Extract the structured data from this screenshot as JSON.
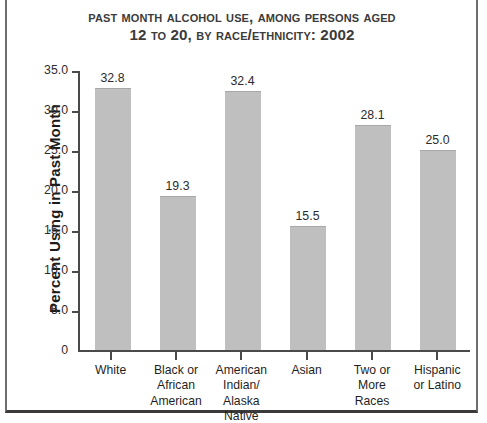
{
  "chart_data": {
    "type": "bar",
    "title": "Past Month Alcohol Use, Among Persons Aged 12 to 20, by Race/Ethnicity: 2002",
    "title_lines": [
      "Past Month Alcohol Use, Among Persons Aged",
      "12 to 20, by Race/Ethnicity: 2002"
    ],
    "xlabel": "",
    "ylabel": "Percent Using in Past Month",
    "categories": [
      "White",
      "Black or\nAfrican\nAmerican",
      "American\nIndian/\nAlaska\nNative",
      "Asian",
      "Two or\nMore\nRaces",
      "Hispanic\nor Latino"
    ],
    "values": [
      32.8,
      19.3,
      32.4,
      15.5,
      28.1,
      25.0
    ],
    "value_labels": [
      "32.8",
      "19.3",
      "32.4",
      "15.5",
      "28.1",
      "25.0"
    ],
    "ylim": [
      0,
      35
    ],
    "yticks": [
      35.0,
      30.0,
      25.0,
      20.0,
      15.0,
      10.0,
      5.0,
      0
    ],
    "ytick_labels": [
      "35.0",
      "30.0",
      "25.0",
      "20.0",
      "15.0",
      "10.0",
      "5.0",
      "0"
    ],
    "grid": false,
    "legend": null,
    "bar_color": "#bfbfbf",
    "axis_color": "#4a4a4a",
    "text_color": "#1f1f1f",
    "title_color": "#3b3b3b",
    "background": "#ffffff"
  }
}
